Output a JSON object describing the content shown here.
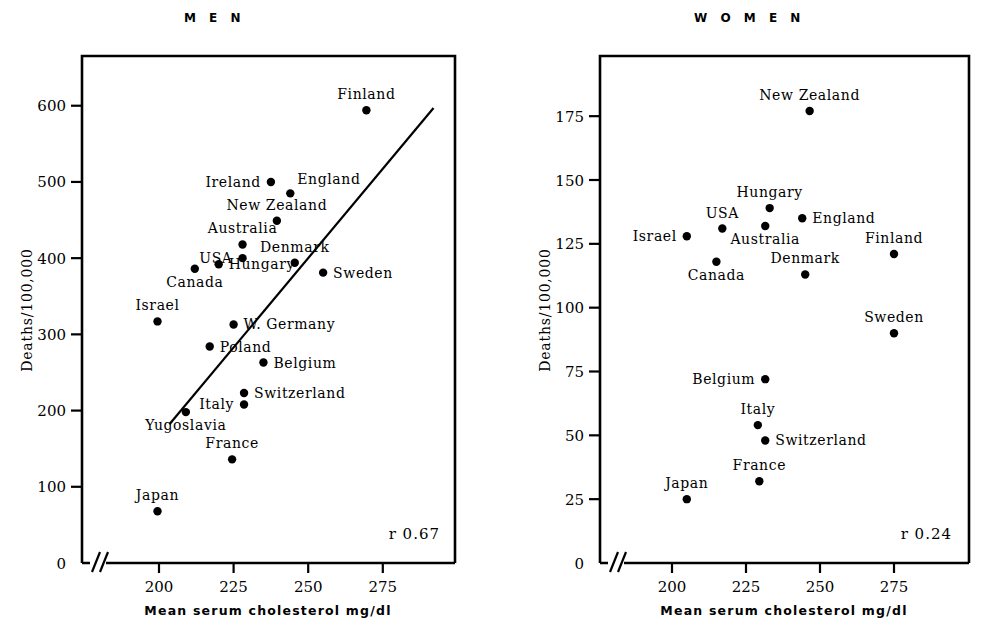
{
  "figure": {
    "axis_color": "#000000",
    "background": "#ffffff",
    "shared_xlabel": "Mean serum cholesterol mg/dl",
    "shared_ylabel": "Deaths/100,000"
  },
  "chart_data": [
    {
      "type": "scatter",
      "title": "M E N",
      "xlabel": "Mean serum cholesterol mg/dl",
      "ylabel": "Deaths/100,000",
      "xlim": [
        188,
        288
      ],
      "ylim": [
        0,
        660
      ],
      "xticks": [
        200,
        225,
        250,
        275
      ],
      "yticks": [
        0,
        100,
        200,
        300,
        400,
        500,
        600
      ],
      "grid": false,
      "axis_break_x": true,
      "annotation": "r  0.67",
      "correlation": 0.67,
      "trendline": {
        "x1": 203.5,
        "y1": 182,
        "x2": 292,
        "y2": 597
      },
      "points": [
        {
          "label": "Finland",
          "x": 269.5,
          "y": 594,
          "label_pos": "above"
        },
        {
          "label": "Ireland",
          "x": 237.5,
          "y": 500,
          "label_pos": "left"
        },
        {
          "label": "England",
          "x": 244,
          "y": 485,
          "label_pos": "right-above"
        },
        {
          "label": "New Zealand",
          "x": 239.5,
          "y": 449,
          "label_pos": "above"
        },
        {
          "label": "Australia",
          "x": 228,
          "y": 418,
          "label_pos": "above"
        },
        {
          "label": "USA",
          "x": 228,
          "y": 400,
          "label_pos": "left"
        },
        {
          "label": "Hungary",
          "x": 220,
          "y": 392,
          "label_pos": "right"
        },
        {
          "label": "Canada",
          "x": 212,
          "y": 386,
          "label_pos": "below"
        },
        {
          "label": "Denmark",
          "x": 245.5,
          "y": 394,
          "label_pos": "above"
        },
        {
          "label": "Sweden",
          "x": 255,
          "y": 381,
          "label_pos": "right"
        },
        {
          "label": "Israel",
          "x": 199.5,
          "y": 317,
          "label_pos": "above"
        },
        {
          "label": "W. Germany",
          "x": 225,
          "y": 313,
          "label_pos": "right"
        },
        {
          "label": "Poland",
          "x": 217,
          "y": 284,
          "label_pos": "right"
        },
        {
          "label": "Belgium",
          "x": 235,
          "y": 263,
          "label_pos": "right"
        },
        {
          "label": "Switzerland",
          "x": 228.5,
          "y": 223,
          "label_pos": "right"
        },
        {
          "label": "Italy",
          "x": 228.5,
          "y": 208,
          "label_pos": "left"
        },
        {
          "label": "Yugoslavia",
          "x": 209,
          "y": 198,
          "label_pos": "below"
        },
        {
          "label": "France",
          "x": 224.5,
          "y": 136,
          "label_pos": "above"
        },
        {
          "label": "Japan",
          "x": 199.5,
          "y": 68,
          "label_pos": "above"
        }
      ]
    },
    {
      "type": "scatter",
      "title": "W O M E N",
      "xlabel": "Mean serum cholesterol mg/dl",
      "ylabel": "Deaths/100,000",
      "xlim": [
        188,
        288
      ],
      "ylim": [
        0,
        197
      ],
      "xticks": [
        200,
        225,
        250,
        275
      ],
      "yticks": [
        0,
        25,
        50,
        75,
        100,
        125,
        150,
        175
      ],
      "grid": false,
      "axis_break_x": true,
      "annotation": "r   0.24",
      "correlation": 0.24,
      "trendline": null,
      "points": [
        {
          "label": "New Zealand",
          "x": 246.5,
          "y": 177,
          "label_pos": "above"
        },
        {
          "label": "Hungary",
          "x": 233,
          "y": 139,
          "label_pos": "above"
        },
        {
          "label": "England",
          "x": 244,
          "y": 135,
          "label_pos": "right"
        },
        {
          "label": "USA",
          "x": 217,
          "y": 131,
          "label_pos": "above"
        },
        {
          "label": "Australia",
          "x": 231.5,
          "y": 132,
          "label_pos": "below"
        },
        {
          "label": "Israel",
          "x": 205,
          "y": 128,
          "label_pos": "left"
        },
        {
          "label": "Finland",
          "x": 275,
          "y": 121,
          "label_pos": "above"
        },
        {
          "label": "Canada",
          "x": 215,
          "y": 118,
          "label_pos": "below"
        },
        {
          "label": "Denmark",
          "x": 245,
          "y": 113,
          "label_pos": "above"
        },
        {
          "label": "Sweden",
          "x": 275,
          "y": 90,
          "label_pos": "above"
        },
        {
          "label": "Belgium",
          "x": 231.5,
          "y": 72,
          "label_pos": "left"
        },
        {
          "label": "Italy",
          "x": 229,
          "y": 54,
          "label_pos": "above"
        },
        {
          "label": "Switzerland",
          "x": 231.5,
          "y": 48,
          "label_pos": "right"
        },
        {
          "label": "France",
          "x": 229.5,
          "y": 32,
          "label_pos": "above"
        },
        {
          "label": "Japan",
          "x": 205,
          "y": 25,
          "label_pos": "above"
        }
      ]
    }
  ]
}
